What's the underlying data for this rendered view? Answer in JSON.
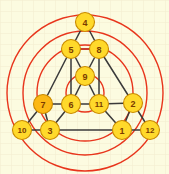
{
  "figure": {
    "background_color": "#fcfbe0",
    "grid_color": "#f0ead0",
    "edge_color": "#3a3a3a",
    "circle_color": "#e8351c",
    "node_fill": "#ffd92b",
    "node_fill_highlight": "#fcb814",
    "node_stroke": "#c98a00",
    "label_color": "#7a3b00"
  },
  "chart_data": {
    "type": "diagram",
    "subtype": "node-link-graph",
    "vertex_count": 12,
    "edge_count": 23,
    "circle_count": 4,
    "nodes": [
      {
        "id": "4",
        "label": "4",
        "x": 85,
        "y": 22,
        "r": 9.5,
        "highlight": false
      },
      {
        "id": "5",
        "label": "5",
        "x": 71,
        "y": 49,
        "r": 9.5,
        "highlight": false
      },
      {
        "id": "8",
        "label": "8",
        "x": 99,
        "y": 49,
        "r": 9.5,
        "highlight": false
      },
      {
        "id": "9",
        "label": "9",
        "x": 85,
        "y": 76,
        "r": 9.5,
        "highlight": false
      },
      {
        "id": "7",
        "label": "7",
        "x": 43,
        "y": 104,
        "r": 9.5,
        "highlight": true
      },
      {
        "id": "6",
        "label": "6",
        "x": 71,
        "y": 104,
        "r": 9.5,
        "highlight": false
      },
      {
        "id": "11",
        "label": "11",
        "x": 99,
        "y": 104,
        "r": 9.5,
        "highlight": false
      },
      {
        "id": "2",
        "label": "2",
        "x": 133,
        "y": 103,
        "r": 9.5,
        "highlight": false
      },
      {
        "id": "10",
        "label": "10",
        "x": 22,
        "y": 130,
        "r": 9.5,
        "highlight": false
      },
      {
        "id": "3",
        "label": "3",
        "x": 50,
        "y": 130,
        "r": 9.5,
        "highlight": false
      },
      {
        "id": "1",
        "label": "1",
        "x": 122,
        "y": 130,
        "r": 9.5,
        "highlight": false
      },
      {
        "id": "12",
        "label": "12",
        "x": 150,
        "y": 130,
        "r": 9.5,
        "highlight": false
      }
    ],
    "edges": [
      {
        "from": "4",
        "to": "5"
      },
      {
        "from": "4",
        "to": "8"
      },
      {
        "from": "5",
        "to": "8"
      },
      {
        "from": "5",
        "to": "9"
      },
      {
        "from": "8",
        "to": "9"
      },
      {
        "from": "5",
        "to": "6"
      },
      {
        "from": "8",
        "to": "11"
      },
      {
        "from": "9",
        "to": "6"
      },
      {
        "from": "9",
        "to": "11"
      },
      {
        "from": "6",
        "to": "11"
      },
      {
        "from": "7",
        "to": "6"
      },
      {
        "from": "11",
        "to": "2"
      },
      {
        "from": "7",
        "to": "5"
      },
      {
        "from": "2",
        "to": "8"
      },
      {
        "from": "7",
        "to": "10"
      },
      {
        "from": "7",
        "to": "3"
      },
      {
        "from": "6",
        "to": "3"
      },
      {
        "from": "11",
        "to": "1"
      },
      {
        "from": "2",
        "to": "1"
      },
      {
        "from": "2",
        "to": "12"
      },
      {
        "from": "10",
        "to": "3"
      },
      {
        "from": "3",
        "to": "1"
      },
      {
        "from": "1",
        "to": "12"
      }
    ],
    "red_edges": [
      {
        "from": "5",
        "to": "8"
      }
    ],
    "circles": [
      {
        "name": "innermost-circle",
        "cx": 85,
        "cy": 93,
        "r": 19
      },
      {
        "name": "inner-circle",
        "cx": 85,
        "cy": 93,
        "r": 48
      },
      {
        "name": "middle-circle",
        "cx": 85,
        "cy": 93,
        "r": 62
      },
      {
        "name": "outer-circle",
        "cx": 85,
        "cy": 93,
        "r": 78
      }
    ]
  }
}
